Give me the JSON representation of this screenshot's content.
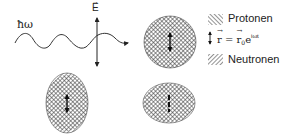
{
  "diagram": {
    "photon": {
      "label": "ħω",
      "field_label": "E",
      "field_vector_symbol": "→"
    },
    "legend": {
      "items": [
        {
          "pattern": "hatch-backslash",
          "label": "Protonen"
        },
        {
          "pattern": "double-arrow",
          "formula": {
            "lhs": "r",
            "eq": " = ",
            "rhs_base": "r",
            "rhs_sub": "0",
            "rhs_exp_base": "e",
            "rhs_exp": "iωt"
          }
        },
        {
          "pattern": "hatch-slash",
          "label": "Neutronen"
        }
      ]
    },
    "nuclei": [
      {
        "name": "spherical-nucleus",
        "shape": "circle",
        "state": "equilibrium"
      },
      {
        "name": "prolate-nucleus",
        "shape": "vertical-ellipse",
        "state": "stretched"
      },
      {
        "name": "oblate-nucleus",
        "shape": "horizontal-ellipse",
        "state": "compressed"
      }
    ],
    "colors": {
      "line": "#222222",
      "hatch": "#444444",
      "fill_background": "#ffffff"
    }
  }
}
